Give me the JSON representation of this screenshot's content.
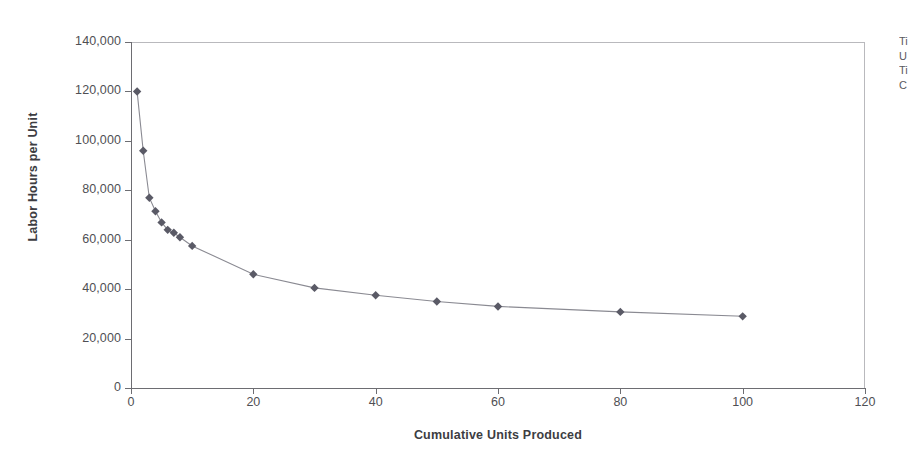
{
  "chart_data": {
    "type": "line",
    "title": "",
    "xlabel": "Cumulative Units Produced",
    "ylabel": "Labor Hours per Unit",
    "xlim": [
      0,
      120
    ],
    "ylim": [
      0,
      140000
    ],
    "grid": false,
    "legend": "none",
    "marker": "diamond",
    "series_color": "#5a5a66",
    "line_color": "#8a8a92",
    "xticks": [
      "0",
      "20",
      "40",
      "60",
      "80",
      "100",
      "120"
    ],
    "xtick_values": [
      0,
      20,
      40,
      60,
      80,
      100,
      120
    ],
    "yticks": [
      "0",
      "20,000",
      "40,000",
      "60,000",
      "80,000",
      "100,000",
      "120,000",
      "140,000"
    ],
    "ytick_values": [
      0,
      20000,
      40000,
      60000,
      80000,
      100000,
      120000,
      140000
    ],
    "series": [
      {
        "name": "Labor Hours per Unit",
        "x": [
          1,
          2,
          3,
          4,
          5,
          6,
          7,
          8,
          10,
          20,
          30,
          40,
          50,
          60,
          80,
          100
        ],
        "values": [
          120000,
          96000,
          77000,
          71500,
          67000,
          64000,
          62800,
          61000,
          57500,
          46000,
          40500,
          37500,
          35000,
          33000,
          30800,
          29000
        ]
      }
    ]
  },
  "side_notes": {
    "lines": [
      "Ti",
      "U",
      "Ti",
      "C"
    ]
  }
}
